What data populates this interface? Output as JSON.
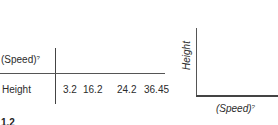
{
  "table": {
    "row_header_1": "(Speed)",
    "row_header_1_sup": "?",
    "row_header_2": "Height",
    "values": [
      "3.2",
      "16.2",
      "24.2",
      "36.45"
    ]
  },
  "graph": {
    "y_axis_label": "Height",
    "x_axis_label": "(Speed)",
    "x_axis_label_sup": "?"
  },
  "figure_number_fragment": "1.2"
}
